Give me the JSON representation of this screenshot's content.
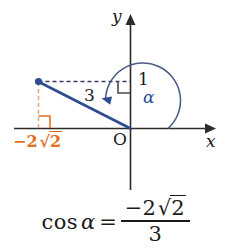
{
  "figure": {
    "type": "coordinate-diagram",
    "background_color": "#ffffff",
    "axes": {
      "x_label": "x",
      "y_label": "y",
      "origin_label": "O",
      "axis_color": "#2b2b2b"
    },
    "point": {
      "color": "#2d4d90",
      "x_value_label": "-2√2",
      "y_value_label": "1"
    },
    "ray": {
      "color": "#2d4d90",
      "length_label": "3"
    },
    "angle": {
      "label": "α",
      "color": "#2d4d90"
    },
    "guides": {
      "vertical_dashed_color": "#e8a06a",
      "horizontal_dashed_color": "#3a3a5a",
      "right_angle_orange_color": "#e2701f",
      "right_angle_dark_color": "#4a4a4a"
    },
    "labels": {
      "three": "3",
      "one": "1",
      "alpha": "α",
      "origin": "O",
      "x_axis": "x",
      "y_axis": "y",
      "neg_two_root_two": "-2√2"
    }
  },
  "formula": {
    "function_name": "cos",
    "argument": "α",
    "equals": "=",
    "numerator_sign": "−",
    "numerator_coefficient": "2",
    "numerator_radical_symbol": "√",
    "numerator_radicand": "2",
    "denominator": "3",
    "full_text": "cos α = -2√2 / 3"
  },
  "orange_label": {
    "sign": "−2",
    "radical_symbol": "√",
    "radicand": "2"
  }
}
